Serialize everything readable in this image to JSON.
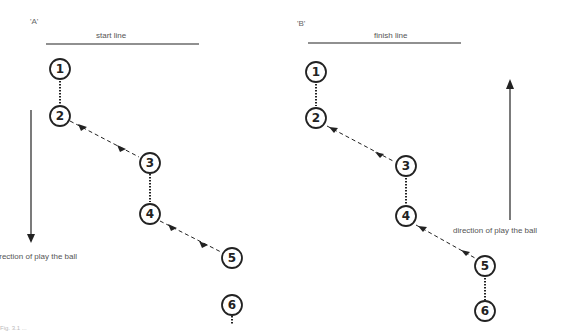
{
  "diagram_a": {
    "panel_label": "'A'",
    "line_label": "start line",
    "direction_label": "direction of play the ball",
    "nodes": [
      "1",
      "2",
      "3",
      "4",
      "5",
      "6"
    ]
  },
  "diagram_b": {
    "panel_label": "'B'",
    "line_label": "finish line",
    "direction_label": "direction of play the ball",
    "nodes": [
      "1",
      "2",
      "3",
      "4",
      "5",
      "6"
    ]
  },
  "caption": "Fig. 3.1 ..."
}
